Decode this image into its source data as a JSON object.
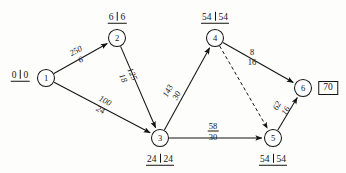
{
  "diagram": {
    "kind": "activity-on-arrow network",
    "canvas": {
      "width": 346,
      "height": 173
    },
    "ink_color": "#141414",
    "background": "#fdfdfb"
  },
  "nodes": [
    {
      "id": "1",
      "label": "1",
      "x": 46,
      "y": 78,
      "r": 8.5,
      "time_label": {
        "early": "0",
        "late": "0",
        "x": 20,
        "y": 76,
        "position": "left"
      }
    },
    {
      "id": "2",
      "label": "2",
      "x": 117,
      "y": 38,
      "r": 8.5,
      "time_label": {
        "early": "6",
        "late": "6",
        "x": 117,
        "y": 18,
        "position": "above"
      }
    },
    {
      "id": "3",
      "label": "3",
      "x": 160,
      "y": 138,
      "r": 8.5,
      "time_label": {
        "early": "24",
        "late": "24",
        "x": 160,
        "y": 160,
        "position": "below"
      }
    },
    {
      "id": "4",
      "label": "4",
      "x": 215,
      "y": 38,
      "r": 8.5,
      "time_label": {
        "early": "54",
        "late": "54",
        "x": 215,
        "y": 18,
        "position": "above"
      }
    },
    {
      "id": "5",
      "label": "5",
      "x": 273,
      "y": 138,
      "r": 8.5,
      "time_label": {
        "early": "54",
        "late": "54",
        "x": 273,
        "y": 160,
        "position": "below"
      }
    },
    {
      "id": "6",
      "label": "6",
      "x": 303,
      "y": 88,
      "r": 8.5,
      "time_label": null
    }
  ],
  "edges": [
    {
      "id": "e1-2",
      "from": "1",
      "to": "2",
      "style": "solid",
      "arrow": true,
      "x1": 46,
      "y1": 78,
      "x2": 117,
      "y2": 38,
      "label": {
        "numerator": "250",
        "denominator": "6",
        "x": 78,
        "y": 55,
        "rotate": -29,
        "ruled": false
      }
    },
    {
      "id": "e1-3",
      "from": "1",
      "to": "3",
      "style": "solid",
      "arrow": true,
      "x1": 46,
      "y1": 78,
      "x2": 160,
      "y2": 138,
      "label": {
        "numerator": "100",
        "denominator": "24",
        "x": 103,
        "y": 105,
        "rotate": 27,
        "ruled": true
      }
    },
    {
      "id": "e2-3",
      "from": "2",
      "to": "3",
      "style": "solid",
      "arrow": true,
      "x1": 117,
      "y1": 38,
      "x2": 160,
      "y2": 138,
      "label": {
        "numerator": "125",
        "denominator": "18",
        "x": 128,
        "y": 76,
        "rotate": 66,
        "ruled": false
      }
    },
    {
      "id": "e3-4",
      "from": "3",
      "to": "4",
      "style": "solid",
      "arrow": true,
      "x1": 160,
      "y1": 138,
      "x2": 215,
      "y2": 38,
      "label": {
        "numerator": "143",
        "denominator": "30",
        "x": 172,
        "y": 93,
        "rotate": -62,
        "ruled": false
      }
    },
    {
      "id": "e3-5",
      "from": "3",
      "to": "5",
      "style": "solid",
      "arrow": true,
      "x1": 160,
      "y1": 138,
      "x2": 273,
      "y2": 138,
      "label": {
        "numerator": "58",
        "denominator": "30",
        "x": 213,
        "y": 131,
        "rotate": 0,
        "ruled": true
      }
    },
    {
      "id": "e4-6",
      "from": "4",
      "to": "6",
      "style": "solid",
      "arrow": true,
      "x1": 215,
      "y1": 38,
      "x2": 303,
      "y2": 88,
      "label": {
        "numerator": "8",
        "denominator": "16",
        "x": 252,
        "y": 57,
        "rotate": 0,
        "ruled": false
      }
    },
    {
      "id": "e4-5",
      "from": "4",
      "to": "5",
      "style": "dashed",
      "arrow": true,
      "x1": 215,
      "y1": 38,
      "x2": 273,
      "y2": 138,
      "label": null
    },
    {
      "id": "e5-6",
      "from": "5",
      "to": "6",
      "style": "solid",
      "arrow": true,
      "x1": 273,
      "y1": 138,
      "x2": 303,
      "y2": 88,
      "label": {
        "numerator": "62",
        "denominator": "16",
        "x": 281,
        "y": 108,
        "rotate": -60,
        "ruled": false
      }
    }
  ],
  "annotations": [
    {
      "id": "project-duration",
      "text": "70",
      "x": 328,
      "y": 88,
      "boxed": true
    }
  ]
}
